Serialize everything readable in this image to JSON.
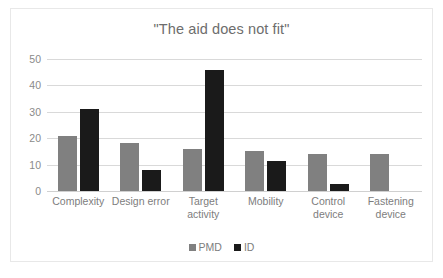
{
  "chart_data": {
    "type": "bar",
    "title": "\"The aid does not fit\"",
    "xlabel": "",
    "ylabel": "",
    "ylim": [
      0,
      50
    ],
    "yticks": [
      "0",
      "10",
      "20",
      "30",
      "40",
      "50"
    ],
    "grid": true,
    "legend_position": "bottom",
    "categories": [
      "Complexity",
      "Design error",
      "Target activity",
      "Mobility",
      "Control device",
      "Fastening device"
    ],
    "series": [
      {
        "name": "PMD",
        "color": "#808080",
        "values": [
          21,
          18,
          16,
          15,
          14,
          14
        ]
      },
      {
        "name": "ID",
        "color": "#1a1a1a",
        "values": [
          31,
          8,
          46,
          11.5,
          2.5,
          0
        ]
      }
    ]
  },
  "colors": {
    "pmd": "#808080",
    "id": "#1a1a1a",
    "title_text": "#6d6d6d",
    "tick_text": "#8a8a8a",
    "gridline": "#d9d9d9",
    "frame": "#e8e8e8"
  }
}
